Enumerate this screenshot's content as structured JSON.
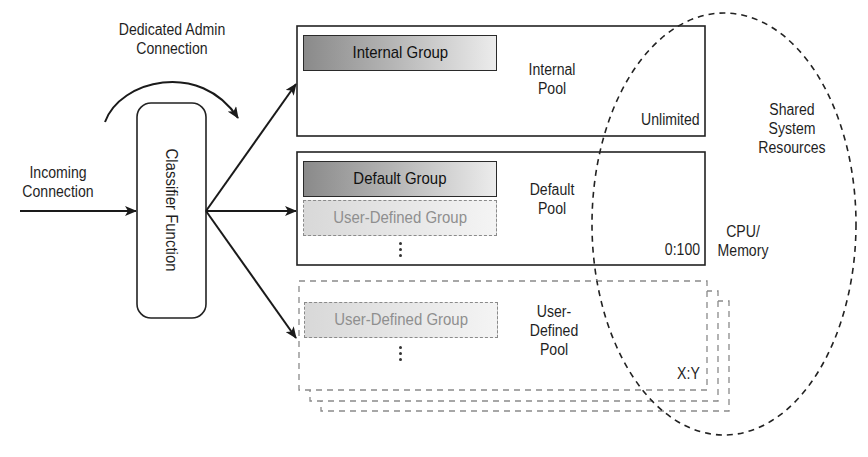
{
  "diagram": {
    "type": "resource-governor-architecture",
    "labels": {
      "dedicated_admin": "Dedicated Admin\nConnection",
      "dedicated_admin_line1": "Dedicated Admin",
      "dedicated_admin_line2": "Connection",
      "incoming_line1": "Incoming",
      "incoming_line2": "Connection",
      "classifier": "Classifier Function",
      "shared_line1": "Shared",
      "shared_line2": "System",
      "shared_line3": "Resources",
      "cpu_line1": "CPU/",
      "cpu_line2": "Memory"
    },
    "pools": [
      {
        "name_line1": "Internal",
        "name_line2": "Pool",
        "limit": "Unlimited",
        "groups": [
          {
            "label": "Internal Group",
            "style": "solid"
          }
        ],
        "border": "solid"
      },
      {
        "name_line1": "Default",
        "name_line2": "Pool",
        "limit": "0:100",
        "groups": [
          {
            "label": "Default Group",
            "style": "solid"
          },
          {
            "label": "User-Defined Group",
            "style": "dashed"
          }
        ],
        "border": "solid"
      },
      {
        "name_line1": "User-",
        "name_line2": "Defined",
        "name_line3": "Pool",
        "limit": "X:Y",
        "groups": [
          {
            "label": "User-Defined Group",
            "style": "dashed"
          }
        ],
        "border": "dashed"
      }
    ],
    "colors": {
      "line": "#1a1a1a",
      "dashed_line": "#8a8a8a",
      "group_fill_dark": "#8a8a8a",
      "group_fill_light": "#ececec",
      "muted_text": "#8f8f8f"
    }
  }
}
